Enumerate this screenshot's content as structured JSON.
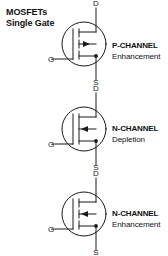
{
  "title": {
    "line1": "MOSFETs",
    "line2": "Single Gate"
  },
  "terminals": {
    "drain": "D",
    "gate": "G",
    "source": "S"
  },
  "colors": {
    "background": "#ffffff",
    "ink": "#1a1a1a",
    "text": "#111111"
  },
  "symbols": [
    {
      "id": "p-channel-enhancement",
      "type_label": "P-CHANNEL",
      "mode_label": "Enhancement",
      "channel_style": "broken",
      "arrow_direction": "right",
      "drain_label": "D",
      "gate_label": "G",
      "source_label": "S"
    },
    {
      "id": "n-channel-depletion",
      "type_label": "N-CHANNEL",
      "mode_label": "Depletion",
      "channel_style": "solid",
      "arrow_direction": "left",
      "drain_label": "D",
      "gate_label": "G",
      "source_label": "S"
    },
    {
      "id": "n-channel-enhancement",
      "type_label": "N-CHANNEL",
      "mode_label": "Enhancement",
      "channel_style": "broken",
      "arrow_direction": "left",
      "drain_label": "D",
      "gate_label": "G",
      "source_label": "S"
    }
  ]
}
